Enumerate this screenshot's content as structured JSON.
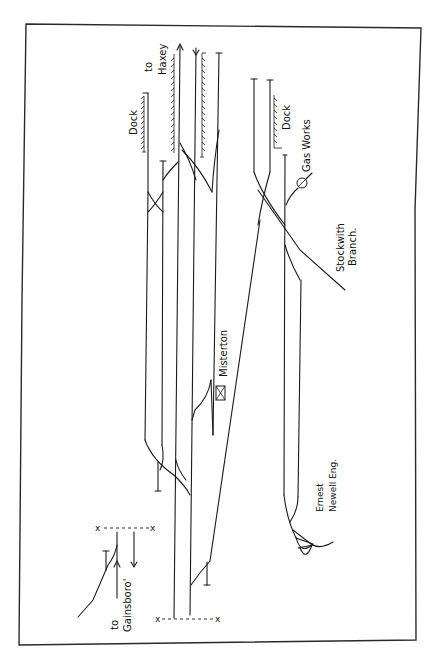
{
  "diagram": {
    "type": "railway-track-plan",
    "orientation": "rotated-90",
    "station": {
      "name": "Misterton"
    },
    "labels": {
      "to_haxey_1": "to",
      "to_haxey_2": "Haxey",
      "dock_left": "Dock",
      "dock_right": "Dock",
      "gas_works": "Gas Works",
      "stockwith_1": "Stockwith",
      "stockwith_2": "Branch.",
      "misterton": "Misterton",
      "ernest_1": "Ernest",
      "ernest_2": "Newell Eng.",
      "to_gainsboro_1": "to",
      "to_gainsboro_2": "Gainsboro'"
    },
    "markers": {
      "x": "x"
    },
    "colors": {
      "ink": "#1a1a1a",
      "background": "#ffffff",
      "frame": "#2a2a2a"
    }
  }
}
